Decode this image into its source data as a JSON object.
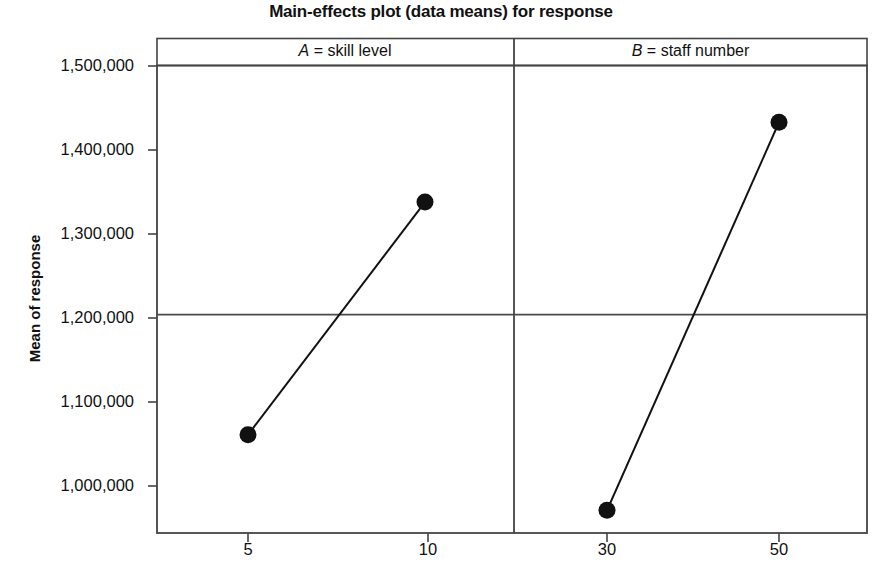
{
  "chart_data": {
    "type": "line",
    "title": "Main-effects plot (data means) for response",
    "xlabel": "",
    "ylabel": "Mean of response",
    "ylim": [
      955000,
      1520000
    ],
    "yticks": [
      1000000,
      1100000,
      1200000,
      1300000,
      1400000,
      1500000
    ],
    "ytick_labels": [
      "1,000,000",
      "1,100,000",
      "1,200,000",
      "1,300,000",
      "1,400,000",
      "1,500,000"
    ],
    "grid": false,
    "legend": "none",
    "reference_line": {
      "value": 1204000,
      "label": "grand mean"
    },
    "panels": [
      {
        "key": "A",
        "factor_letter": "A",
        "header": "A = skill level",
        "header_rest": " = skill level",
        "categories": [
          "5",
          "10"
        ],
        "values": [
          1061000,
          1338000
        ]
      },
      {
        "key": "B",
        "factor_letter": "B",
        "header": "B = staff number",
        "header_rest": " = staff number",
        "categories": [
          "30",
          "50"
        ],
        "values": [
          971000,
          1433000
        ]
      }
    ],
    "marker": {
      "shape": "filled-circle",
      "color": "#111111",
      "size_px": 13
    },
    "line_color": "#111111",
    "axis_color": "#444444"
  }
}
